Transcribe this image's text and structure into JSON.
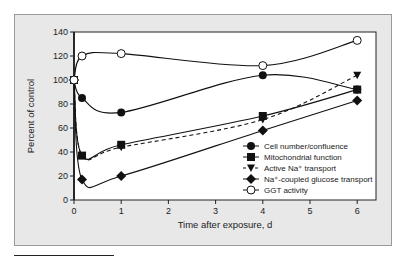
{
  "chart_data": {
    "type": "line",
    "title": "",
    "xlabel": "Time after exposure, d",
    "ylabel": "Percent of control",
    "xlim": [
      0,
      6.3
    ],
    "ylim": [
      0,
      140
    ],
    "xticks": [
      0,
      1,
      2,
      3,
      4,
      5,
      6
    ],
    "yticks": [
      0,
      20,
      40,
      60,
      80,
      100,
      120,
      140
    ],
    "grid": false,
    "legend_position": "bottom-right",
    "series": [
      {
        "name": "Cell number/confluence",
        "marker": "circle-filled",
        "line": "solid",
        "points": [
          [
            0,
            100
          ],
          [
            0.17,
            85
          ],
          [
            1,
            73
          ],
          [
            4,
            104
          ],
          [
            6,
            92
          ]
        ]
      },
      {
        "name": "Mitochondrial function",
        "marker": "square-filled",
        "line": "solid",
        "points": [
          [
            0,
            100
          ],
          [
            0.17,
            37
          ],
          [
            1,
            46
          ],
          [
            4,
            70
          ],
          [
            6,
            92
          ]
        ]
      },
      {
        "name": "Active Na⁺ transport",
        "marker": "triangle-down-filled",
        "line": "dashed",
        "points": [
          [
            0,
            100
          ],
          [
            0.17,
            37
          ],
          [
            1,
            44
          ],
          [
            4,
            67
          ],
          [
            6,
            104
          ]
        ]
      },
      {
        "name": "Na⁺-coupled glucose transport",
        "marker": "diamond-filled",
        "line": "solid",
        "points": [
          [
            0,
            100
          ],
          [
            0.17,
            17
          ],
          [
            1,
            20
          ],
          [
            4,
            58
          ],
          [
            6,
            83
          ]
        ]
      },
      {
        "name": "GGT activity",
        "marker": "circle-open",
        "line": "solid",
        "points": [
          [
            0,
            100
          ],
          [
            0.17,
            120
          ],
          [
            1,
            122
          ],
          [
            4,
            112
          ],
          [
            6,
            133
          ]
        ]
      }
    ]
  }
}
